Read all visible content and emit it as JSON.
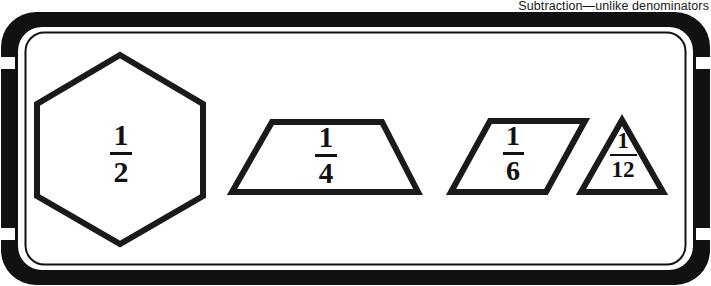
{
  "caption": {
    "text": "Subtraction—unlike denominators"
  },
  "panel": {
    "background_color": "#ffffff",
    "border_color": "#111111",
    "inner_line_color": "#111111"
  },
  "shapes": [
    {
      "id": "hexagon",
      "name": "hexagon-one-half",
      "sides": 6,
      "fraction": {
        "numerator": "1",
        "denominator": "2"
      },
      "stroke_color": "#1a1a1a",
      "fill_color": "#ffffff"
    },
    {
      "id": "trapezoid",
      "name": "trapezoid-one-fourth",
      "sides": 4,
      "fraction": {
        "numerator": "1",
        "denominator": "4"
      },
      "stroke_color": "#1a1a1a",
      "fill_color": "#ffffff"
    },
    {
      "id": "parallelogram",
      "name": "parallelogram-one-sixth",
      "sides": 4,
      "fraction": {
        "numerator": "1",
        "denominator": "6"
      },
      "stroke_color": "#1a1a1a",
      "fill_color": "#ffffff"
    },
    {
      "id": "triangle",
      "name": "triangle-one-twelfth",
      "sides": 3,
      "fraction": {
        "numerator": "1",
        "denominator": "12"
      },
      "stroke_color": "#1a1a1a",
      "fill_color": "#ffffff"
    }
  ]
}
